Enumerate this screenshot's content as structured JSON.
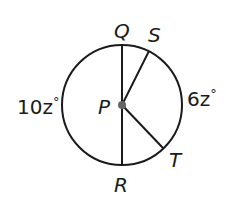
{
  "diagram": {
    "type": "circle-with-radii",
    "circle": {
      "cx": 122,
      "cy": 105,
      "r": 60,
      "stroke": "#1a1a1a"
    },
    "center": {
      "label": "P",
      "x": 122,
      "y": 105
    },
    "points": {
      "Q": {
        "label": "Q",
        "x": 122,
        "y": 45
      },
      "S": {
        "label": "S",
        "x": 149,
        "y": 51
      },
      "T": {
        "label": "T",
        "x": 163,
        "y": 148
      },
      "R": {
        "label": "R",
        "x": 122,
        "y": 165
      }
    },
    "segments": [
      {
        "from": "Q",
        "to": "R",
        "kind": "diameter"
      },
      {
        "from": "P",
        "to": "S",
        "kind": "radius"
      },
      {
        "from": "P",
        "to": "T",
        "kind": "radius"
      }
    ],
    "arc_labels": {
      "left": {
        "var": "10z",
        "degree": "°",
        "text": "10z°"
      },
      "right": {
        "var": "6z",
        "degree": "°",
        "text": "6z°"
      }
    }
  }
}
